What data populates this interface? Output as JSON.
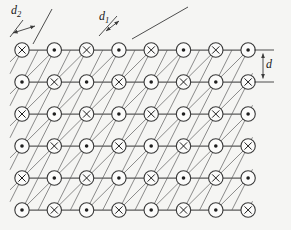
{
  "figure": {
    "width": 291,
    "height": 230,
    "background": "#f5f5f3"
  },
  "colors": {
    "oblique_line": "#6e6e6e",
    "row_line": "#5a5a5a",
    "node_stroke": "#383838",
    "node_fill": "#fbfbfa",
    "symbol": "#1e1e1e",
    "annotation": "#3a3a3a",
    "label": "#1a1a1a"
  },
  "lattice": {
    "cols_x": [
      22,
      54.3,
      86.6,
      118.9,
      151.2,
      183.5,
      215.8,
      248.1
    ],
    "rows_y": [
      50,
      82,
      114,
      146,
      178,
      210
    ],
    "node_radius": 7.2,
    "symbols": [
      [
        "x",
        "o",
        "x",
        "o",
        "x",
        "o",
        "x",
        "o"
      ],
      [
        "o",
        "x",
        "o",
        "x",
        "o",
        "x",
        "o",
        "x"
      ],
      [
        "x",
        "o",
        "x",
        "o",
        "x",
        "o",
        "x",
        "o"
      ],
      [
        "o",
        "x",
        "o",
        "x",
        "o",
        "x",
        "o",
        "x"
      ],
      [
        "x",
        "o",
        "x",
        "o",
        "x",
        "o",
        "x",
        "o"
      ],
      [
        "o",
        "x",
        "o",
        "x",
        "o",
        "x",
        "o",
        "x"
      ]
    ],
    "symbol_meanings": {
      "x": "spin-into-page",
      "o": "spin-out-of-page"
    }
  },
  "lines": {
    "row": {
      "x_start": 18,
      "x_end": 251,
      "width": 1.25
    },
    "clip": {
      "x_min": 10,
      "x_max": 252.5,
      "y_min": 50,
      "y_max": 210
    },
    "oblique_families": [
      {
        "name": "d1-diagonal-45deg",
        "x_top_start": 22,
        "x_top_step": 32.3,
        "count": 13,
        "dx_per_dy": -1.0094,
        "width": 0.8
      },
      {
        "name": "d2-steep-63deg",
        "x_top_start": 22,
        "x_top_step": 16.15,
        "count": 20,
        "dx_per_dy": -0.5047,
        "width": 0.8
      }
    ]
  },
  "annotations": {
    "d2": {
      "label_main": "d",
      "label_sub": "2",
      "ticks": [
        {
          "x1": 10,
          "y1": 37,
          "x2": 23,
          "y2": 20
        },
        {
          "x1": 33,
          "y1": 44,
          "x2": 52,
          "y2": 9
        }
      ],
      "arrow": {
        "x1": 13,
        "y1": 33,
        "x2": 35,
        "y2": 26
      }
    },
    "d1": {
      "label_main": "d",
      "label_sub": "1",
      "ticks": [
        {
          "x1": 99,
          "y1": 36,
          "x2": 117,
          "y2": 16
        },
        {
          "x1": 132,
          "y1": 39,
          "x2": 188,
          "y2": 7
        }
      ],
      "arrow": {
        "x1": 106,
        "y1": 31,
        "x2": 119,
        "y2": 21
      }
    },
    "d": {
      "label_main": "d",
      "label_sub": "",
      "ticks": [
        {
          "x1": 254,
          "y1": 50,
          "x2": 274,
          "y2": 50
        },
        {
          "x1": 254,
          "y1": 82,
          "x2": 274,
          "y2": 82
        }
      ],
      "arrow": {
        "x1": 263,
        "y1": 53.5,
        "x2": 263,
        "y2": 78.5
      }
    }
  }
}
